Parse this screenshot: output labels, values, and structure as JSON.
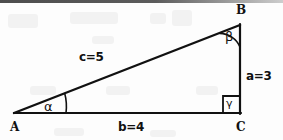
{
  "figure": {
    "type": "right-triangle-diagram",
    "stroke_color": "#111111",
    "background_color": "#fdfdfd",
    "vertices": [
      {
        "id": "A",
        "label": "A",
        "x": 14,
        "y": 113,
        "label_x": 10,
        "label_y": 121
      },
      {
        "id": "B",
        "label": "B",
        "x": 240,
        "y": 25,
        "label_x": 236,
        "label_y": 4
      },
      {
        "id": "C",
        "label": "C",
        "x": 240,
        "y": 113,
        "label_x": 236,
        "label_y": 121
      }
    ],
    "sides": [
      {
        "id": "a",
        "label": "a=3",
        "from": "B",
        "to": "C",
        "length": 3,
        "label_x": 246,
        "label_y": 70
      },
      {
        "id": "b",
        "label": "b=4",
        "from": "A",
        "to": "C",
        "length": 4,
        "label_x": 118,
        "label_y": 121
      },
      {
        "id": "c",
        "label": "c=5",
        "from": "A",
        "to": "B",
        "length": 5,
        "label_x": 79,
        "label_y": 51
      }
    ],
    "angles": [
      {
        "id": "alpha",
        "label": "α",
        "at_vertex": "A",
        "label_x": 44,
        "label_y": 100,
        "arc_radius": 52
      },
      {
        "id": "beta",
        "label": "β",
        "at_vertex": "B",
        "label_x": 225,
        "label_y": 30,
        "arc_radius": 22
      },
      {
        "id": "gamma",
        "label": "γ",
        "at_vertex": "C",
        "label_x": 226,
        "label_y": 98,
        "right_angle_size": 17
      }
    ]
  }
}
